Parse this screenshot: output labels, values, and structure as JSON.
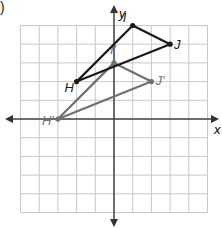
{
  "figure": {
    "part_marker": ")",
    "x_axis_label": "x",
    "y_axis_label": "y",
    "grid": {
      "xmin": -5,
      "xmax": 5,
      "ymin": -5,
      "ymax": 5
    },
    "colors": {
      "original": "#1a1a1a",
      "image": "#707070",
      "grid": "#c8c8c8",
      "axis": "#444444"
    },
    "original_triangle": {
      "points": [
        {
          "label": "H",
          "x": -2,
          "y": 2
        },
        {
          "label": "I",
          "x": 1,
          "y": 5
        },
        {
          "label": "J",
          "x": 3,
          "y": 4
        }
      ]
    },
    "image_triangle": {
      "points": [
        {
          "label": "H'",
          "x": -3,
          "y": 0
        },
        {
          "label": "I'",
          "x": 0,
          "y": 3
        },
        {
          "label": "J'",
          "x": 2,
          "y": 2
        }
      ]
    }
  }
}
